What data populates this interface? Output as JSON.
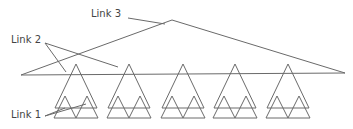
{
  "labels": {
    "link3": "Link 3",
    "link2": "Link 2",
    "link1": "Link 1"
  },
  "colors": {
    "stroke": "#6a6a6a",
    "text": "#444444",
    "background": "#ffffff"
  },
  "structure": {
    "description": "Hierarchical tree of triangles showing three link levels",
    "big_triangles": 5,
    "small_triangles_per_big": 2
  }
}
